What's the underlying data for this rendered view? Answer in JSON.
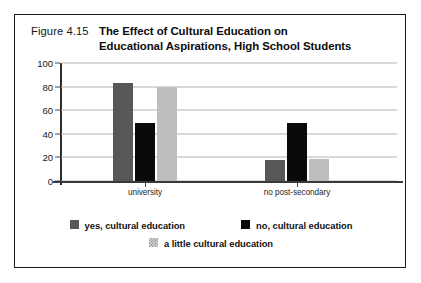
{
  "figure": {
    "number_label": "Figure 4.15",
    "title_line_1": "The Effect of Cultural Education on",
    "title_line_2": "Educational Aspirations, High School Students",
    "border_color": "#1c1c1c"
  },
  "chart_data": {
    "type": "bar",
    "title": "The Effect of Cultural Education on Educational Aspirations, High School Students",
    "xlabel": "",
    "ylabel": "",
    "ylim": [
      0,
      100
    ],
    "yticks": [
      0,
      20,
      40,
      60,
      80,
      100
    ],
    "ytick_labels": [
      "0",
      "20",
      "40",
      "60",
      "80",
      "100"
    ],
    "grid": true,
    "legend_position": "bottom",
    "categories": [
      "university",
      "no post-secondary"
    ],
    "series": [
      {
        "name": "yes, cultural education",
        "color": "#585858",
        "values": [
          83,
          18
        ]
      },
      {
        "name": "no, cultural education",
        "color": "#0a0a0a",
        "values": [
          49,
          49
        ]
      },
      {
        "name": "a little cultural education",
        "color": "#bebebe",
        "values": [
          80,
          19
        ]
      }
    ]
  },
  "legend": {
    "row_1": [
      {
        "label": "yes, cultural education",
        "swatch": "sw-s0"
      },
      {
        "label": "no, cultural education",
        "swatch": "sw-s1"
      }
    ],
    "row_2": [
      {
        "label": "a little cultural education",
        "swatch": "sw-s2"
      }
    ]
  }
}
